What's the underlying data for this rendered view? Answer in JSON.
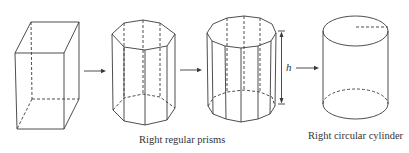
{
  "diagram": {
    "shapes": [
      {
        "id": "rectangular-prism",
        "label": ""
      },
      {
        "id": "octagonal-prism",
        "label": ""
      },
      {
        "id": "decagonal-prism",
        "label": ""
      },
      {
        "id": "circular-cylinder",
        "label": ""
      }
    ],
    "height_label": "h",
    "captions": {
      "prisms": "Right regular prisms",
      "cylinder": "Right circular cylinder"
    },
    "colors": {
      "stroke": "#3a3a3a",
      "text": "#333333",
      "background": "#ffffff"
    }
  }
}
